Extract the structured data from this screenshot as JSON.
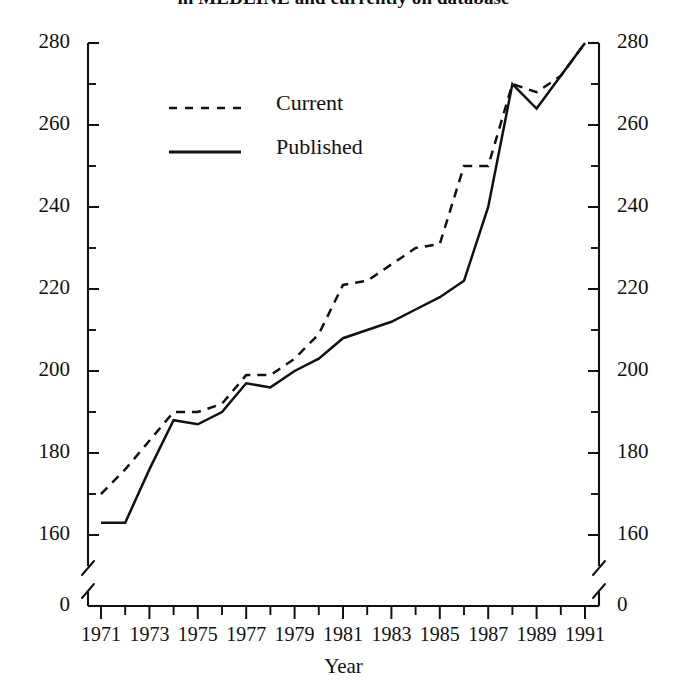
{
  "chart_data": {
    "type": "line",
    "title": "in MEDLINE and currently on database",
    "xlabel": "Year",
    "ylabel": "",
    "x": [
      1971,
      1972,
      1973,
      1974,
      1975,
      1976,
      1977,
      1978,
      1979,
      1980,
      1981,
      1982,
      1983,
      1984,
      1985,
      1986,
      1987,
      1988,
      1989,
      1990,
      1991
    ],
    "xlim": [
      1971,
      1991
    ],
    "ylim": [
      155,
      280
    ],
    "y_break_at_zero": true,
    "grid": false,
    "legend_position": "upper-left-inside",
    "x_tick_labels": [
      "1971",
      "1973",
      "1975",
      "1977",
      "1979",
      "1981",
      "1983",
      "1985",
      "1987",
      "1989",
      "1991"
    ],
    "x_tick_values": [
      1971,
      1973,
      1975,
      1977,
      1979,
      1981,
      1983,
      1985,
      1987,
      1989,
      1991
    ],
    "x_minor_ticks_every": 1,
    "y_tick_labels": [
      "0",
      "160",
      "180",
      "200",
      "220",
      "240",
      "260",
      "280"
    ],
    "y_tick_values": [
      0,
      160,
      180,
      200,
      220,
      240,
      260,
      280
    ],
    "y_minor_ticks_every": 10,
    "dual_y_axis": true,
    "series": [
      {
        "name": "Current",
        "style": "dashed",
        "color": "#111111",
        "values": [
          170,
          176,
          183,
          190,
          190,
          192,
          199,
          199,
          203,
          209,
          221,
          222,
          226,
          230,
          231,
          250,
          250,
          270,
          268,
          272,
          280
        ]
      },
      {
        "name": "Published",
        "style": "solid",
        "color": "#111111",
        "values": [
          163,
          163,
          176,
          188,
          187,
          190,
          197,
          196,
          200,
          203,
          208,
          210,
          212,
          215,
          218,
          222,
          240,
          270,
          264,
          272,
          280
        ]
      }
    ]
  },
  "axis": {
    "x_title": "Year"
  },
  "legend": {
    "entries": [
      {
        "label": "Current",
        "style": "dashed"
      },
      {
        "label": "Published",
        "style": "solid"
      }
    ]
  }
}
